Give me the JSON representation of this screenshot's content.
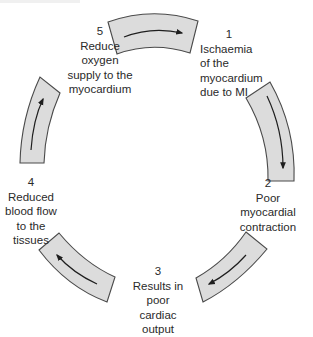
{
  "diagram": {
    "type": "cycle",
    "colors": {
      "segment_fill": "#dcdcdc",
      "segment_stroke": "#4a4a4a",
      "arrow": "#1e1e1e",
      "text": "#2a2a2a"
    },
    "steps": [
      {
        "number": "1",
        "lines": [
          "Ischaemia",
          "of the",
          "myocardium",
          "due to MI"
        ]
      },
      {
        "number": "2",
        "lines": [
          "Poor",
          "myocardial",
          "contraction"
        ]
      },
      {
        "number": "3",
        "lines": [
          "Results in",
          "poor",
          "cardiac",
          "output"
        ]
      },
      {
        "number": "4",
        "lines": [
          "Reduced",
          "blood flow",
          "to the",
          "tissues"
        ]
      },
      {
        "number": "5",
        "lines": [
          "Reduce",
          "oxygen",
          "supply to the",
          "myocardium"
        ]
      }
    ],
    "flow": [
      "1 → 2",
      "2 → 3",
      "3 → 4",
      "4 → 5",
      "5 → 1"
    ]
  }
}
